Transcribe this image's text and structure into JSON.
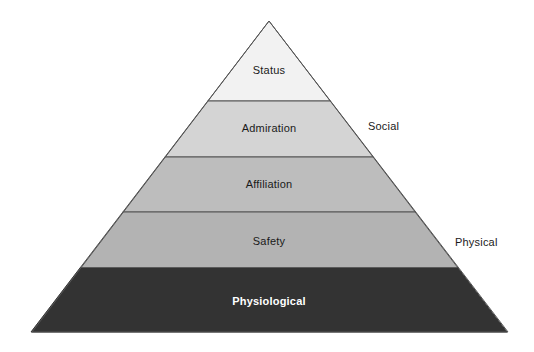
{
  "diagram": {
    "type": "pyramid",
    "background_color": "#ffffff",
    "outline_color": "#555555",
    "apex": {
      "x": 269,
      "y": 21
    },
    "base_left": {
      "x": 32,
      "y": 332
    },
    "base_right": {
      "x": 508,
      "y": 332
    },
    "tiers": [
      {
        "id": "status",
        "label": "Status",
        "level": 5,
        "fill": "#f2f2f2",
        "text_color": "#1a1a1a",
        "bold": false,
        "top_y": 21,
        "bottom_y": 101,
        "label_x": 269,
        "label_y": 70
      },
      {
        "id": "admiration",
        "label": "Admiration",
        "level": 4,
        "fill": "#d4d4d4",
        "text_color": "#1a1a1a",
        "bold": false,
        "top_y": 101,
        "bottom_y": 157,
        "label_x": 269,
        "label_y": 128
      },
      {
        "id": "affiliation",
        "label": "Affiliation",
        "level": 3,
        "fill": "#bdbdbd",
        "text_color": "#1a1a1a",
        "bold": false,
        "top_y": 157,
        "bottom_y": 212,
        "label_x": 269,
        "label_y": 184
      },
      {
        "id": "safety",
        "label": "Safety",
        "level": 2,
        "fill": "#b3b3b3",
        "text_color": "#1a1a1a",
        "bold": false,
        "top_y": 212,
        "bottom_y": 268,
        "label_x": 269,
        "label_y": 241
      },
      {
        "id": "physiological",
        "label": "Physiological",
        "level": 1,
        "fill": "#333333",
        "text_color": "#ffffff",
        "bold": true,
        "top_y": 268,
        "bottom_y": 332,
        "label_x": 269,
        "label_y": 301
      }
    ],
    "side_labels": [
      {
        "id": "social",
        "label": "Social",
        "x": 368,
        "y": 126
      },
      {
        "id": "physical",
        "label": "Physical",
        "x": 455,
        "y": 242
      }
    ]
  }
}
